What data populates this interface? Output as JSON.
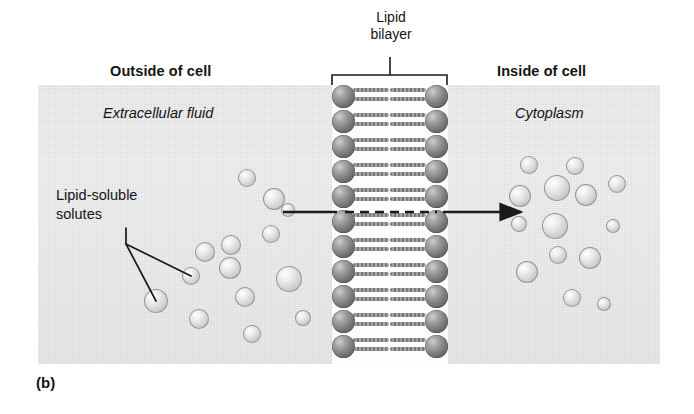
{
  "figure": {
    "letter": "(b)",
    "panel_color": "#e9e9e9",
    "line_color": "#1a1a1a"
  },
  "labels": {
    "outside": "Outside of cell",
    "inside": "Inside of cell",
    "bilayer_line1": "Lipid",
    "bilayer_line2": "bilayer",
    "extracellular": "Extracellular fluid",
    "cytoplasm": "Cytoplasm",
    "solutes_line1": "Lipid-soluble",
    "solutes_line2": "solutes"
  },
  "membrane": {
    "rows": 11,
    "row_height": 25,
    "top": 85,
    "left": 332,
    "width": 116,
    "height": 279,
    "head_color": "#6d6d6d"
  },
  "bracket": {
    "x1": 332,
    "x2": 447,
    "y": 75,
    "stem_x": 390,
    "stem_top": 57
  },
  "arrow": {
    "solid_left": {
      "x1": 283,
      "x2": 337,
      "y": 212
    },
    "dashed": {
      "x1": 345,
      "x2": 437,
      "y": 212
    },
    "solid_right": {
      "x1": 443,
      "x2": 521,
      "y": 212
    },
    "head_x": 521
  },
  "leaders": [
    {
      "from_x": 126,
      "from_y": 228,
      "vx": 126,
      "vy": 244,
      "to_x": 191,
      "to_y": 276
    },
    {
      "from_x": 126,
      "from_y": 244,
      "to_x": 156,
      "to_y": 301
    }
  ],
  "solutes_extracellular": [
    {
      "cx": 247,
      "cy": 178,
      "r": 9
    },
    {
      "cx": 274,
      "cy": 199,
      "r": 11
    },
    {
      "cx": 271,
      "cy": 234,
      "r": 9
    },
    {
      "cx": 231,
      "cy": 245,
      "r": 10
    },
    {
      "cx": 205,
      "cy": 252,
      "r": 10
    },
    {
      "cx": 230,
      "cy": 268,
      "r": 11
    },
    {
      "cx": 191,
      "cy": 276,
      "r": 9
    },
    {
      "cx": 156,
      "cy": 301,
      "r": 12
    },
    {
      "cx": 289,
      "cy": 279,
      "r": 13
    },
    {
      "cx": 245,
      "cy": 297,
      "r": 10
    },
    {
      "cx": 199,
      "cy": 319,
      "r": 10
    },
    {
      "cx": 252,
      "cy": 334,
      "r": 9
    },
    {
      "cx": 303,
      "cy": 318,
      "r": 8
    },
    {
      "cx": 288,
      "cy": 210,
      "r": 7
    }
  ],
  "solutes_cytoplasm": [
    {
      "cx": 529,
      "cy": 165,
      "r": 9
    },
    {
      "cx": 575,
      "cy": 166,
      "r": 9
    },
    {
      "cx": 557,
      "cy": 188,
      "r": 13
    },
    {
      "cx": 520,
      "cy": 196,
      "r": 11
    },
    {
      "cx": 586,
      "cy": 195,
      "r": 11
    },
    {
      "cx": 617,
      "cy": 184,
      "r": 9
    },
    {
      "cx": 555,
      "cy": 226,
      "r": 13
    },
    {
      "cx": 519,
      "cy": 224,
      "r": 8
    },
    {
      "cx": 558,
      "cy": 255,
      "r": 9
    },
    {
      "cx": 590,
      "cy": 258,
      "r": 11
    },
    {
      "cx": 527,
      "cy": 272,
      "r": 11
    },
    {
      "cx": 572,
      "cy": 298,
      "r": 9
    },
    {
      "cx": 613,
      "cy": 226,
      "r": 7
    },
    {
      "cx": 604,
      "cy": 304,
      "r": 7
    }
  ]
}
